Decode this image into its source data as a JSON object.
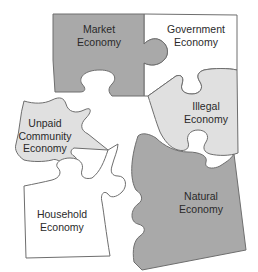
{
  "diagram": {
    "type": "jigsaw-puzzle",
    "colors": {
      "dark_fill": "#a9a9a9",
      "light_fill": "#e0e0e0",
      "white_fill": "#ffffff",
      "outline": "#6e6e6e",
      "text": "#2a2a2a"
    },
    "pieces": [
      {
        "id": "market",
        "line1": "Market",
        "line2": "Economy",
        "fill": "dark"
      },
      {
        "id": "government",
        "line1": "Government",
        "line2": "Economy",
        "fill": "white"
      },
      {
        "id": "illegal",
        "line1": "Illegal",
        "line2": "Economy",
        "fill": "light"
      },
      {
        "id": "unpaid",
        "line1": "Unpaid",
        "line2": "Community",
        "line3": "Economy",
        "fill": "light"
      },
      {
        "id": "natural",
        "line1": "Natural",
        "line2": "Economy",
        "fill": "dark"
      },
      {
        "id": "household",
        "line1": "Household",
        "line2": "Economy",
        "fill": "white"
      }
    ]
  }
}
